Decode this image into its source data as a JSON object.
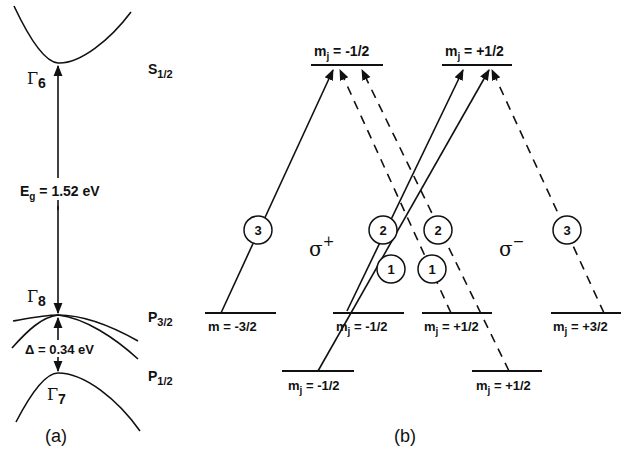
{
  "panel_a": {
    "label": "(a)",
    "gamma6": {
      "sym": "Γ",
      "sub": "6"
    },
    "gamma8": {
      "sym": "Γ",
      "sub": "8"
    },
    "gamma7": {
      "sym": "Γ",
      "sub": "7"
    },
    "s_state": {
      "main": "S",
      "sub": "1/2"
    },
    "p32_state": {
      "main": "P",
      "sub": "3/2"
    },
    "p12_state": {
      "main": "P",
      "sub": "1/2"
    },
    "gap": {
      "main": "E",
      "sub": "g",
      "rest": " = 1.52 eV"
    },
    "split_off": "Δ = 0.34 eV"
  },
  "panel_b": {
    "label": "(b)",
    "sigma_plus": {
      "sym": "σ",
      "sup": "+"
    },
    "sigma_minus": {
      "sym": "σ",
      "sup": "−"
    },
    "levels": {
      "s_minus_half": {
        "m": "m",
        "sub": "j",
        "val": " = -1/2"
      },
      "s_plus_half": {
        "m": "m",
        "sub": "j",
        "val": " = +1/2"
      },
      "p32_minus_3half": {
        "m": "m",
        "sub": "",
        "val": "  = -3/2"
      },
      "p32_minus_half": {
        "m": "m",
        "sub": "j",
        "val": " = -1/2"
      },
      "p32_plus_half": {
        "m": "m",
        "sub": "j",
        "val": " = +1/2"
      },
      "p32_plus_3half": {
        "m": "m",
        "sub": "j",
        "val": " = +3/2"
      },
      "p12_minus_half": {
        "m": "m",
        "sub": "j",
        "val": " = -1/2"
      },
      "p12_plus_half": {
        "m": "m",
        "sub": "j",
        "val": " = +1/2"
      }
    },
    "transition_weights": {
      "sp_from_m3half": "3",
      "sp_from_mhalf_p32": "2",
      "sp_from_mhalf_p12": "1",
      "sm_from_phalf_p32": "2",
      "sm_from_phalf_p12": "1",
      "sm_from_p3half": "3"
    },
    "legend": {
      "solid_line": "σ+ transitions",
      "dashed_line": "σ− transitions"
    }
  }
}
